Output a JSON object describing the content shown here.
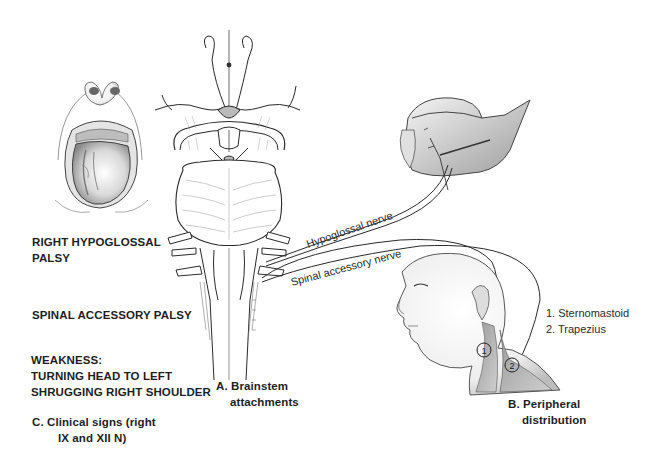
{
  "figure": {
    "panels": {
      "A": {
        "letter": "A.",
        "line1": "A. Brainstem",
        "line2": "attachments"
      },
      "B": {
        "line1": "B. Peripheral",
        "line2": "distribution"
      },
      "C": {
        "line1": "C. Clinical signs (right",
        "line2": "IX and XII N)"
      }
    },
    "clinical_labels": {
      "hypoglossal_palsy": {
        "line1": "RIGHT HYPOGLOSSAL",
        "line2": "PALSY"
      },
      "spinal_accessory_palsy": "SPINAL ACCESSORY PALSY",
      "weakness": {
        "line1": "WEAKNESS:",
        "line2": "TURNING HEAD TO LEFT",
        "line3": "SHRUGGING RIGHT SHOULDER"
      }
    },
    "nerves": {
      "hypoglossal": "Hypoglossal nerve",
      "spinal_accessory": "Spinal accessory nerve"
    },
    "muscles": {
      "legend": [
        {
          "number": "1",
          "label": "1. Sternomastoid"
        },
        {
          "number": "2",
          "label": "2. Trapezius"
        }
      ]
    },
    "colors": {
      "ink": "#1e1e1e",
      "shade": "#b8b8b8",
      "background": "#ffffff"
    }
  }
}
